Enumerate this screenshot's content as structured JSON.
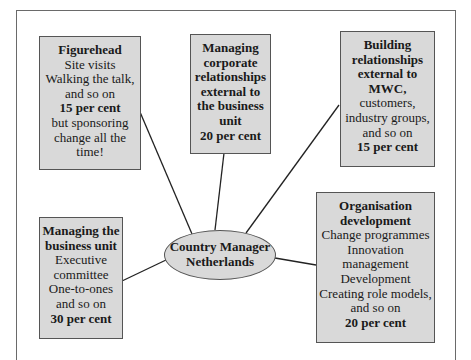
{
  "diagram": {
    "center": {
      "lines": [
        "Country Manager",
        "Netherlands"
      ]
    },
    "boxes": [
      {
        "id": "figurehead",
        "lines": [
          {
            "text": "Figurehead",
            "bold": true
          },
          {
            "text": "Site visits",
            "bold": false
          },
          {
            "text": "Walking the talk,",
            "bold": false
          },
          {
            "text": "and so on",
            "bold": false
          },
          {
            "text": "15 per cent",
            "bold": true
          },
          {
            "text": "but sponsoring",
            "bold": false
          },
          {
            "text": "change all the",
            "bold": false
          },
          {
            "text": "time!",
            "bold": false
          }
        ],
        "percent": "15 per cent"
      },
      {
        "id": "corporate-relationships",
        "lines": [
          {
            "text": "Managing",
            "bold": true
          },
          {
            "text": "corporate",
            "bold": true
          },
          {
            "text": "relationships",
            "bold": true
          },
          {
            "text": "external to",
            "bold": true
          },
          {
            "text": "the business",
            "bold": true
          },
          {
            "text": "unit",
            "bold": true
          },
          {
            "text": "20 per cent",
            "bold": true
          }
        ],
        "percent": "20 per cent"
      },
      {
        "id": "external-relationships",
        "lines": [
          {
            "text": "Building",
            "bold": true
          },
          {
            "text": "relationships",
            "bold": true
          },
          {
            "text": "external to",
            "bold": true
          },
          {
            "text": "MWC,",
            "bold": true
          },
          {
            "text": "customers,",
            "bold": false
          },
          {
            "text": "industry groups,",
            "bold": false
          },
          {
            "text": "and so on",
            "bold": false
          },
          {
            "text": "15 per cent",
            "bold": true
          }
        ],
        "percent": "15 per cent"
      },
      {
        "id": "business-unit",
        "lines": [
          {
            "text": "Managing the",
            "bold": true
          },
          {
            "text": "business unit",
            "bold": true
          },
          {
            "text": "Executive",
            "bold": false
          },
          {
            "text": "committee",
            "bold": false
          },
          {
            "text": "One-to-ones",
            "bold": false
          },
          {
            "text": "and so on",
            "bold": false
          },
          {
            "text": "30 per cent",
            "bold": true
          }
        ],
        "percent": "30 per cent"
      },
      {
        "id": "organisation-development",
        "lines": [
          {
            "text": "Organisation",
            "bold": true
          },
          {
            "text": "development",
            "bold": true
          },
          {
            "text": "Change programmes",
            "bold": false
          },
          {
            "text": "Innovation",
            "bold": false
          },
          {
            "text": "management",
            "bold": false
          },
          {
            "text": "Development",
            "bold": false
          },
          {
            "text": "Creating role models,",
            "bold": false
          },
          {
            "text": "and so on",
            "bold": false
          },
          {
            "text": "20 per cent",
            "bold": true
          }
        ],
        "percent": "20 per cent"
      }
    ],
    "colors": {
      "box_fill": "#d9d9d9",
      "border": "#555555",
      "line": "#222222"
    }
  }
}
